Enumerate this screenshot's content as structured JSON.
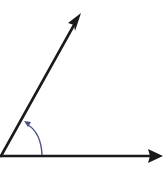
{
  "diagram": {
    "type": "angle",
    "vertex": {
      "x": 1,
      "y": 156
    },
    "rays": [
      {
        "name": "initial-side",
        "direction": "horizontal-right",
        "end": {
          "x": 162,
          "y": 156
        }
      },
      {
        "name": "terminal-side",
        "direction": "up-right",
        "end": {
          "x": 80,
          "y": 14
        }
      }
    ],
    "angle_arc": {
      "direction": "counterclockwise",
      "color": "#4a4f86"
    },
    "colors": {
      "background": "#ffffff",
      "rays": "#1a1a1a",
      "arc": "#4a4f86"
    }
  }
}
